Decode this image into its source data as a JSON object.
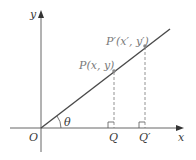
{
  "diagram": {
    "type": "coordinate-rotation-projection",
    "labels": {
      "y_axis": "y",
      "x_axis": "x",
      "origin": "O",
      "angle": "θ",
      "point_p": "P(x, y)",
      "point_p_prime": "P′(x′, y′)",
      "foot_q": "Q",
      "foot_q_prime": "Q′"
    },
    "geometry": {
      "origin": [
        41,
        128
      ],
      "x_axis_end": [
        184,
        128
      ],
      "y_axis_top": [
        41,
        10
      ],
      "y_axis_bottom": [
        41,
        152
      ],
      "x_axis_left": [
        10,
        128
      ],
      "line_end": [
        170,
        29
      ],
      "point_p": [
        114,
        71
      ],
      "point_p_prime": [
        145,
        46
      ],
      "foot_q": [
        114,
        128
      ],
      "foot_q_prime": [
        145,
        128
      ]
    },
    "colors": {
      "axis": "#555555",
      "line": "#4a4a4a",
      "dashed": "#888888",
      "point": "#8a8a8a",
      "label": "#3a3a3a",
      "label_light": "#7a7a7a"
    }
  }
}
